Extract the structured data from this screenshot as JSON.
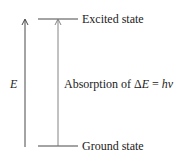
{
  "diagram": {
    "type": "energy-level",
    "levels": [
      {
        "name": "excited",
        "label": "Excited state"
      },
      {
        "name": "ground",
        "label": "Ground state"
      }
    ],
    "axis_label": "E",
    "transition": {
      "prefix": "Absorption of ",
      "delta": "Δ",
      "var": "E",
      "eq": " = ",
      "rhs": "hν"
    },
    "colors": {
      "line": "#333333",
      "text": "#222222"
    }
  }
}
